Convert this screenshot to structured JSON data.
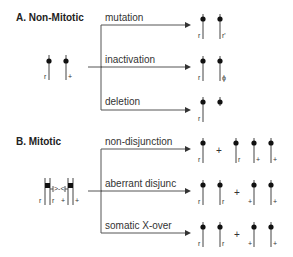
{
  "sections": [
    {
      "title": "A. Non-Mitotic",
      "start": {
        "labels": [
          "r",
          "+"
        ]
      },
      "branches": [
        {
          "label": "mutation",
          "result": [
            {
              "label": "r"
            },
            {
              "label": "r'"
            }
          ]
        },
        {
          "label": "inactivation",
          "result": [
            {
              "label": "r"
            },
            {
              "label": "ϕ"
            }
          ]
        },
        {
          "label": "deletion",
          "result": [
            {
              "label": "r"
            },
            {
              "label": ""
            }
          ]
        }
      ]
    },
    {
      "title": "B. Mitotic",
      "start": {
        "labels": [
          "r",
          "r",
          "+",
          "+"
        ]
      },
      "branches": [
        {
          "label": "non-disjunction",
          "result": [
            {
              "label": "r"
            },
            {
              "label": "+"
            },
            {
              "label": "r"
            },
            {
              "label": "+"
            },
            {
              "label": "+"
            }
          ]
        },
        {
          "label": "aberrant disjunc",
          "result": [
            {
              "label": "r"
            },
            {
              "label": "r"
            },
            {
              "label": "+"
            },
            {
              "label": "+"
            },
            {
              "label": "+"
            }
          ]
        },
        {
          "label": "somatic X-over",
          "result": [
            {
              "label": "r"
            },
            {
              "label": "r"
            },
            {
              "label": "+"
            },
            {
              "label": "+"
            },
            {
              "label": "+"
            }
          ]
        }
      ]
    }
  ]
}
